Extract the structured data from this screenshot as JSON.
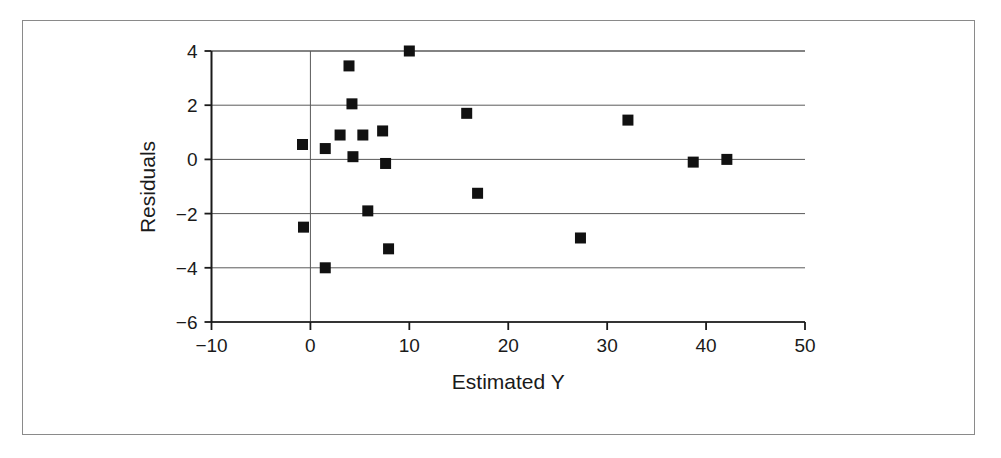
{
  "chart_data": {
    "type": "scatter",
    "title": "",
    "xlabel": "Estimated Y",
    "ylabel": "Residuals",
    "xlim": [
      -10,
      50
    ],
    "ylim": [
      -6,
      4
    ],
    "xticks": [
      -10,
      0,
      10,
      20,
      30,
      40,
      50
    ],
    "yticks": [
      -6,
      -4,
      -2,
      0,
      2,
      4
    ],
    "xtick_labels": [
      "−10",
      "0",
      "10",
      "20",
      "30",
      "40",
      "50"
    ],
    "ytick_labels": [
      "−6",
      "−4",
      "−2",
      "0",
      "2",
      "4"
    ],
    "grid": "horizontal-gridlines-at-yticks-plus-vertical-line-at-x0",
    "legend": "none",
    "marker": {
      "shape": "square",
      "color": "#111111",
      "size_px": 11
    },
    "points": [
      {
        "x": -0.8,
        "y": 0.55
      },
      {
        "x": -0.7,
        "y": -2.5
      },
      {
        "x": 1.5,
        "y": 0.4
      },
      {
        "x": 1.5,
        "y": -4.0
      },
      {
        "x": 3.0,
        "y": 0.9
      },
      {
        "x": 3.9,
        "y": 3.45
      },
      {
        "x": 4.2,
        "y": 2.05
      },
      {
        "x": 4.3,
        "y": 0.1
      },
      {
        "x": 5.3,
        "y": 0.9
      },
      {
        "x": 5.8,
        "y": -1.9
      },
      {
        "x": 7.3,
        "y": 1.05
      },
      {
        "x": 7.6,
        "y": -0.15
      },
      {
        "x": 7.9,
        "y": -3.3
      },
      {
        "x": 10.0,
        "y": 4.0
      },
      {
        "x": 15.8,
        "y": 1.7
      },
      {
        "x": 16.9,
        "y": -1.25
      },
      {
        "x": 27.3,
        "y": -2.9
      },
      {
        "x": 32.1,
        "y": 1.45
      },
      {
        "x": 38.7,
        "y": -0.1
      },
      {
        "x": 42.1,
        "y": 0.0
      }
    ]
  },
  "colors": {
    "axis": "#1a1a1a",
    "gridline": "#5a5a5a",
    "marker": "#111111",
    "frame": "#8a8a8a",
    "text": "#1a1a1a"
  }
}
